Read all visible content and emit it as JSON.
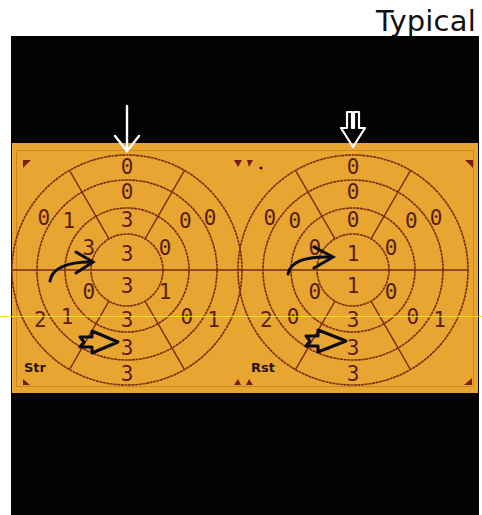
{
  "title": "Typical",
  "colors": {
    "background": "#ffffff",
    "frame": "#030303",
    "panel": "#e8a532",
    "grid_line": "#7a2e10",
    "score_text": "#5a1e0c",
    "marker": "#7a1c10",
    "white_arrow": "#ffffff",
    "black_arrow": "#0a0a18",
    "scan_line": "#f5e31a"
  },
  "maps": [
    {
      "label": "Str",
      "view": "stress",
      "top_arrow": "thin-down-arrow",
      "ring_scores": {
        "apex": [
          "3",
          "3"
        ],
        "apical": {
          "anterior": "3",
          "lateral": "0",
          "inferior": "3",
          "septal": "3",
          "anteroseptal_left": "3",
          "inferolateral": "1",
          "inferoseptal": "0"
        },
        "note": "scores listed per segment below"
      },
      "segments": [
        {
          "ring": "outer",
          "position": "top",
          "value": "0"
        },
        {
          "ring": "outer",
          "position": "upper-left",
          "value": "0"
        },
        {
          "ring": "outer",
          "position": "upper-right",
          "value": "0"
        },
        {
          "ring": "outer",
          "position": "lower-left",
          "value": "2"
        },
        {
          "ring": "outer",
          "position": "lower-right",
          "value": "1"
        },
        {
          "ring": "outer",
          "position": "bottom",
          "value": "3"
        },
        {
          "ring": "middle",
          "position": "top",
          "value": "0"
        },
        {
          "ring": "middle",
          "position": "upper-left",
          "value": "1"
        },
        {
          "ring": "middle",
          "position": "upper-right",
          "value": "0"
        },
        {
          "ring": "middle",
          "position": "lower-left",
          "value": "1"
        },
        {
          "ring": "middle",
          "position": "lower-right",
          "value": "0"
        },
        {
          "ring": "middle",
          "position": "bottom",
          "value": "3"
        },
        {
          "ring": "inner",
          "position": "top",
          "value": "3"
        },
        {
          "ring": "inner",
          "position": "left",
          "value": "3"
        },
        {
          "ring": "inner",
          "position": "right",
          "value": "0"
        },
        {
          "ring": "inner",
          "position": "lower-left",
          "value": "0"
        },
        {
          "ring": "inner",
          "position": "lower-right",
          "value": "1"
        },
        {
          "ring": "inner",
          "position": "bottom",
          "value": "3"
        },
        {
          "ring": "apex",
          "position": "top",
          "value": "3"
        },
        {
          "ring": "apex",
          "position": "bottom",
          "value": "3"
        }
      ]
    },
    {
      "label": "Rst",
      "view": "rest",
      "top_arrow": "open-down-arrow",
      "segments": [
        {
          "ring": "outer",
          "position": "top",
          "value": "0"
        },
        {
          "ring": "outer",
          "position": "upper-left",
          "value": "0"
        },
        {
          "ring": "outer",
          "position": "upper-right",
          "value": "0"
        },
        {
          "ring": "outer",
          "position": "lower-left",
          "value": "2"
        },
        {
          "ring": "outer",
          "position": "lower-right",
          "value": "1"
        },
        {
          "ring": "outer",
          "position": "bottom",
          "value": "3"
        },
        {
          "ring": "middle",
          "position": "top",
          "value": "0"
        },
        {
          "ring": "middle",
          "position": "upper-left",
          "value": "0"
        },
        {
          "ring": "middle",
          "position": "upper-right",
          "value": "0"
        },
        {
          "ring": "middle",
          "position": "lower-left",
          "value": "0"
        },
        {
          "ring": "middle",
          "position": "lower-right",
          "value": "0"
        },
        {
          "ring": "middle",
          "position": "bottom",
          "value": "3"
        },
        {
          "ring": "inner",
          "position": "top",
          "value": "0"
        },
        {
          "ring": "inner",
          "position": "left",
          "value": "0"
        },
        {
          "ring": "inner",
          "position": "right",
          "value": "0"
        },
        {
          "ring": "inner",
          "position": "lower-left",
          "value": "0"
        },
        {
          "ring": "inner",
          "position": "lower-right",
          "value": "0"
        },
        {
          "ring": "inner",
          "position": "bottom",
          "value": "3"
        },
        {
          "ring": "apex",
          "position": "top",
          "value": "1"
        },
        {
          "ring": "apex",
          "position": "bottom",
          "value": "1"
        }
      ]
    }
  ],
  "annotations": [
    {
      "type": "curved-arrow",
      "map": "Str",
      "points_to": "inner-left segment"
    },
    {
      "type": "open-arrow",
      "map": "Str",
      "points_to": "middle-bottom segment"
    },
    {
      "type": "curved-arrow",
      "map": "Rst",
      "points_to": "apex-top segment"
    },
    {
      "type": "open-arrow",
      "map": "Rst",
      "points_to": "middle-bottom segment"
    }
  ]
}
